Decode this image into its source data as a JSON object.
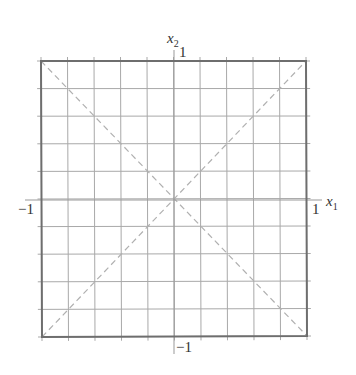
{
  "diagram": {
    "type": "unit square grid with diagonals",
    "grid_divisions": 10,
    "x_range": [
      -1,
      1
    ],
    "y_range": [
      -1,
      1
    ],
    "axes": {
      "x_label": "x",
      "x_subscript": "1",
      "y_label": "x",
      "y_subscript": "2"
    },
    "ticks": {
      "x_min": "−1",
      "x_max": "1",
      "y_min": "−1",
      "y_max": "1"
    },
    "diagonals": [
      "x2 = x1",
      "x2 = -x1"
    ],
    "colors": {
      "border": "#6e6e6e",
      "grid": "#a9a9a9",
      "diagonal": "#b0b0b0",
      "text": "#333333"
    }
  }
}
